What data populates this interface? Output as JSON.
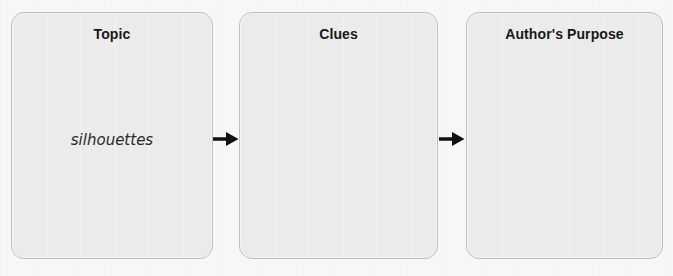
{
  "diagram": {
    "type": "three-column-graphic-organizer",
    "background_color": "#f7f7f7",
    "box_fill_color": "#ebebeb",
    "box_border_color": "#bfbfbf",
    "arrow_color": "#111111",
    "boxes": [
      {
        "id": "topic",
        "heading": "Topic",
        "answer": "silhouettes",
        "answer_style": "handwritten"
      },
      {
        "id": "clues",
        "heading": "Clues",
        "answer": "",
        "answer_style": "handwritten"
      },
      {
        "id": "authors-purpose",
        "heading": "Author's Purpose",
        "answer": "",
        "answer_style": "handwritten"
      }
    ],
    "arrows": [
      {
        "id": "topic-to-clues",
        "from": "topic",
        "to": "clues",
        "direction": "right",
        "glyph": "arrow-right-icon"
      },
      {
        "id": "clues-to-authors-purpose",
        "from": "clues",
        "to": "authors-purpose",
        "direction": "right",
        "glyph": "arrow-right-icon"
      }
    ]
  }
}
